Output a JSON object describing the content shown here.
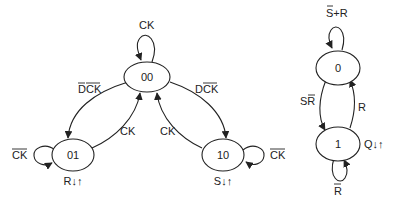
{
  "diagram_left": {
    "states": [
      {
        "id": "00",
        "label": "00"
      },
      {
        "id": "01",
        "label": "01",
        "output": "R↓↑"
      },
      {
        "id": "10",
        "label": "10",
        "output": "S↓↑"
      }
    ],
    "transitions": {
      "loop_00": "CK",
      "t_00_01": "DCK",
      "t_01_00": "CK",
      "t_00_10": "DCK",
      "t_10_00": "CK",
      "loop_01": "CK",
      "loop_10": "CK"
    }
  },
  "diagram_right": {
    "states": [
      {
        "id": "0",
        "label": "0"
      },
      {
        "id": "1",
        "label": "1",
        "output": "Q↓↑"
      }
    ],
    "transitions": {
      "loop_0": "S+R",
      "t_0_1": "SR",
      "t_1_0": "R",
      "loop_1": "R"
    }
  }
}
